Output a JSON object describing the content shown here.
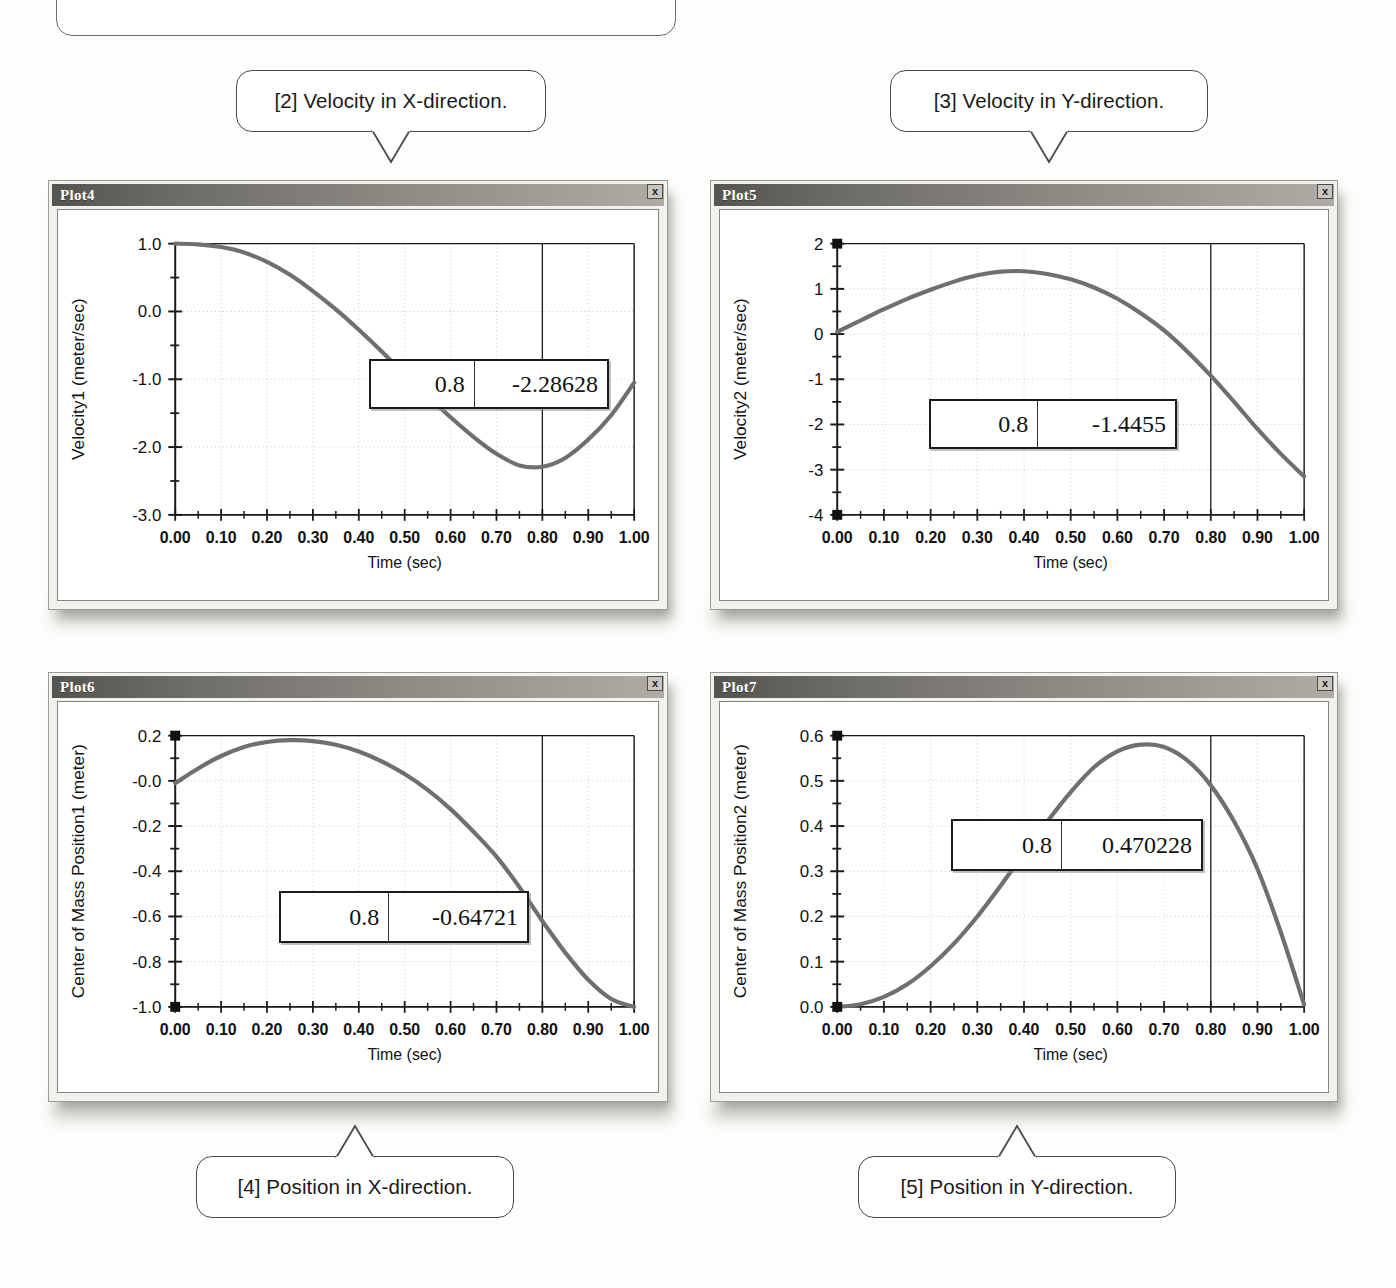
{
  "figure": {
    "cropped_top_callout_fragment": "pression ( p    ), ( ),  g    )    and   p                 [  ]"
  },
  "callouts": [
    {
      "id": "callout-2",
      "text": "[2] Velocity in X-direction.",
      "points_to": "Plot4",
      "direction": "down"
    },
    {
      "id": "callout-3",
      "text": "[3] Velocity in Y-direction.",
      "points_to": "Plot5",
      "direction": "down"
    },
    {
      "id": "callout-4",
      "text": "[4] Position in X-direction.",
      "points_to": "Plot6",
      "direction": "up"
    },
    {
      "id": "callout-5",
      "text": "[5] Position in Y-direction.",
      "points_to": "Plot7",
      "direction": "up"
    }
  ],
  "plots": [
    {
      "window_title": "Plot4",
      "close_label": "x",
      "readout": {
        "x": "0.8",
        "y": "-2.28628"
      },
      "chart_data": {
        "type": "line",
        "title": "",
        "xlabel": "Time (sec)",
        "ylabel": "Velocity1 (meter/sec)",
        "xlim": [
          0.0,
          1.0
        ],
        "ylim": [
          -3.0,
          1.0
        ],
        "xticks": [
          "0.00",
          "0.10",
          "0.20",
          "0.30",
          "0.40",
          "0.50",
          "0.60",
          "0.70",
          "0.80",
          "0.90",
          "1.00"
        ],
        "yticks": [
          "1.0",
          "0.0",
          "-1.0",
          "-2.0",
          "-3.0"
        ],
        "grid": true,
        "cursor_x": 0.8,
        "x": [
          0.0,
          0.05,
          0.1,
          0.15,
          0.2,
          0.25,
          0.3,
          0.35,
          0.4,
          0.45,
          0.5,
          0.55,
          0.6,
          0.65,
          0.7,
          0.75,
          0.8,
          0.85,
          0.9,
          0.95,
          1.0
        ],
        "y": [
          1.0,
          0.99,
          0.95,
          0.87,
          0.73,
          0.54,
          0.3,
          0.03,
          -0.27,
          -0.59,
          -0.93,
          -1.25,
          -1.56,
          -1.85,
          -2.1,
          -2.27,
          -2.29,
          -2.16,
          -1.89,
          -1.53,
          -1.05
        ]
      }
    },
    {
      "window_title": "Plot5",
      "close_label": "x",
      "readout": {
        "x": "0.8",
        "y": "-1.4455"
      },
      "chart_data": {
        "type": "line",
        "title": "",
        "xlabel": "Time (sec)",
        "ylabel": "Velocity2 (meter/sec)",
        "xlim": [
          0.0,
          1.0
        ],
        "ylim": [
          -4.0,
          2.0
        ],
        "xticks": [
          "0.00",
          "0.10",
          "0.20",
          "0.30",
          "0.40",
          "0.50",
          "0.60",
          "0.70",
          "0.80",
          "0.90",
          "1.00"
        ],
        "yticks": [
          "2",
          "1",
          "0",
          "-1",
          "-2",
          "-3",
          "-4"
        ],
        "grid": true,
        "cursor_x": 0.8,
        "x": [
          0.0,
          0.05,
          0.1,
          0.15,
          0.2,
          0.25,
          0.3,
          0.35,
          0.4,
          0.45,
          0.5,
          0.55,
          0.6,
          0.65,
          0.7,
          0.75,
          0.8,
          0.85,
          0.9,
          0.95,
          1.0
        ],
        "y": [
          0.05,
          0.3,
          0.55,
          0.78,
          0.98,
          1.16,
          1.3,
          1.38,
          1.39,
          1.33,
          1.21,
          1.03,
          0.78,
          0.46,
          0.08,
          -0.39,
          -0.92,
          -1.5,
          -2.1,
          -2.65,
          -3.15
        ]
      }
    },
    {
      "window_title": "Plot6",
      "close_label": "x",
      "readout": {
        "x": "0.8",
        "y": "-0.64721"
      },
      "chart_data": {
        "type": "line",
        "title": "",
        "xlabel": "Time (sec)",
        "ylabel": "Center of Mass Position1 (meter)",
        "xlim": [
          0.0,
          1.0
        ],
        "ylim": [
          -1.0,
          0.2
        ],
        "xticks": [
          "0.00",
          "0.10",
          "0.20",
          "0.30",
          "0.40",
          "0.50",
          "0.60",
          "0.70",
          "0.80",
          "0.90",
          "1.00"
        ],
        "yticks": [
          "0.2",
          "-0.0",
          "-0.2",
          "-0.4",
          "-0.6",
          "-0.8",
          "-1.0"
        ],
        "grid": true,
        "cursor_x": 0.8,
        "x": [
          0.0,
          0.05,
          0.1,
          0.15,
          0.2,
          0.25,
          0.3,
          0.35,
          0.4,
          0.45,
          0.5,
          0.55,
          0.6,
          0.65,
          0.7,
          0.75,
          0.8,
          0.85,
          0.9,
          0.95,
          1.0
        ],
        "y": [
          -0.01,
          0.055,
          0.11,
          0.15,
          0.172,
          0.18,
          0.176,
          0.16,
          0.13,
          0.086,
          0.03,
          -0.04,
          -0.125,
          -0.225,
          -0.335,
          -0.47,
          -0.62,
          -0.76,
          -0.88,
          -0.965,
          -1.0
        ]
      }
    },
    {
      "window_title": "Plot7",
      "close_label": "x",
      "readout": {
        "x": "0.8",
        "y": "0.470228"
      },
      "chart_data": {
        "type": "line",
        "title": "",
        "xlabel": "Time (sec)",
        "ylabel": "Center of Mass Position2 (meter)",
        "xlim": [
          0.0,
          1.0
        ],
        "ylim": [
          0.0,
          0.6
        ],
        "xticks": [
          "0.00",
          "0.10",
          "0.20",
          "0.30",
          "0.40",
          "0.50",
          "0.60",
          "0.70",
          "0.80",
          "0.90",
          "1.00"
        ],
        "yticks": [
          "0.6",
          "0.5",
          "0.4",
          "0.3",
          "0.2",
          "0.1",
          "0.0"
        ],
        "grid": true,
        "cursor_x": 0.8,
        "x": [
          0.0,
          0.05,
          0.1,
          0.15,
          0.2,
          0.25,
          0.3,
          0.35,
          0.4,
          0.45,
          0.5,
          0.55,
          0.6,
          0.65,
          0.7,
          0.75,
          0.8,
          0.85,
          0.9,
          0.95,
          1.0
        ],
        "y": [
          0.0,
          0.006,
          0.022,
          0.05,
          0.09,
          0.14,
          0.2,
          0.268,
          0.34,
          0.41,
          0.475,
          0.53,
          0.565,
          0.58,
          0.575,
          0.545,
          0.49,
          0.41,
          0.305,
          0.165,
          0.005
        ]
      }
    }
  ],
  "colors": {
    "curve": "#6f6f6f",
    "axis": "#1b1b1b",
    "grid": "#c9c9c9",
    "titlebar_dark": "#56544f",
    "titlebar_light": "#aeaca4",
    "window_face": "#f1f1ee"
  }
}
